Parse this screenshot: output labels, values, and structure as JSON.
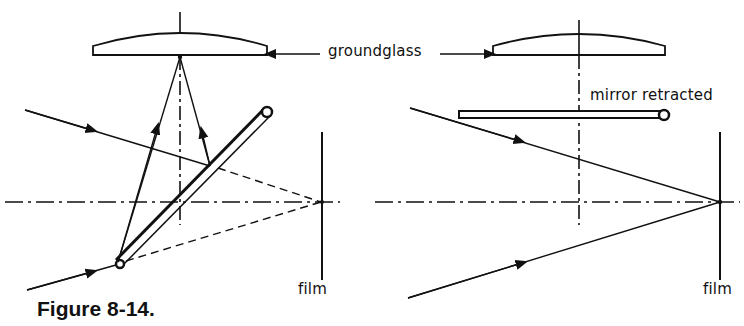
{
  "figure": {
    "caption": "Figure 8-14.",
    "labels": {
      "groundglass": "groundglass",
      "mirror_retracted": "mirror retracted",
      "film_left": "film",
      "film_right": "film"
    },
    "panels": [
      {
        "id": "mirror-down",
        "description": "Reflex mirror at 45° reflecting incoming rays up to the ground glass; dashed lines show where rays would focus on film",
        "components": [
          "ground glass",
          "45° mirror with pivot",
          "optical axis",
          "film plane",
          "incoming rays",
          "reflected rays",
          "virtual (dashed) rays to film"
        ]
      },
      {
        "id": "mirror-up",
        "description": "Mirror retracted horizontally; incoming rays pass directly to focus on the film plane",
        "components": [
          "ground glass",
          "retracted mirror",
          "optical axis",
          "film plane",
          "incoming rays"
        ]
      }
    ],
    "colors": {
      "ink": "#111111",
      "background": "#ffffff"
    }
  }
}
